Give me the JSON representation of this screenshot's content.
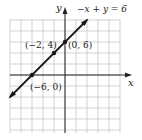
{
  "chart_data": {
    "type": "line",
    "title": "",
    "equation_label": "−x + y = 6",
    "xlabel": "x",
    "ylabel": "y",
    "xlim": [
      -10,
      10
    ],
    "ylim": [
      -10,
      10
    ],
    "grid": true,
    "grid_step": 2,
    "series": [
      {
        "name": "−x + y = 6",
        "x": [
          -10,
          4
        ],
        "y": [
          -4,
          10
        ]
      }
    ],
    "points": [
      {
        "x": -6,
        "y": 0,
        "label": "(−6, 0)"
      },
      {
        "x": -2,
        "y": 4,
        "label": "(−2, 4)"
      },
      {
        "x": 0,
        "y": 6,
        "label": "(0, 6)"
      }
    ]
  },
  "colors": {
    "grid": "#c8c8c8",
    "axis": "#222222",
    "line": "#1a1a1a"
  }
}
